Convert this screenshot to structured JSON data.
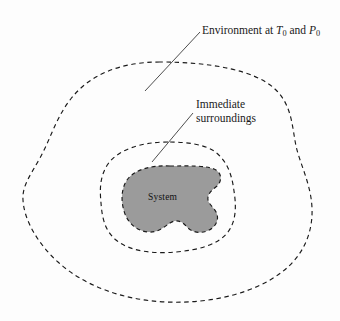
{
  "figure": {
    "background_color": "#fdfdfd",
    "width": 340,
    "height": 321
  },
  "labels": {
    "environment": {
      "text_prefix": "Environment at ",
      "temperature_symbol": "T",
      "temperature_subscript": "0",
      "conjunction": " and ",
      "pressure_symbol": "P",
      "pressure_subscript": "0",
      "full_text": "Environment at T0 and P0"
    },
    "immediate_surroundings": {
      "line1": "Immediate",
      "line2": "surroundings",
      "full_text": "Immediate surroundings"
    },
    "system": {
      "text": "System"
    }
  },
  "regions": [
    {
      "name": "environment-boundary",
      "style": "dashed",
      "fill": "none",
      "stroke": "#1a1a1a",
      "order": "outermost"
    },
    {
      "name": "immediate-surroundings-boundary",
      "style": "dashed",
      "fill": "none",
      "stroke": "#1a1a1a",
      "order": "middle"
    },
    {
      "name": "system-boundary",
      "style": "dashed",
      "fill": "#9b9b9b",
      "stroke": "#1a1a1a",
      "order": "innermost"
    }
  ],
  "leader_lines": [
    {
      "name": "environment-leader",
      "from_label": "environment",
      "points": "200,32 145,91"
    },
    {
      "name": "immediate-surroundings-leader",
      "from_label": "immediate_surroundings",
      "points": "193,113 152,162"
    }
  ],
  "colors": {
    "stroke": "#1a1a1a",
    "system_fill": "#9b9b9b",
    "text": "#1a1a1a",
    "background": "#fdfdfd"
  }
}
